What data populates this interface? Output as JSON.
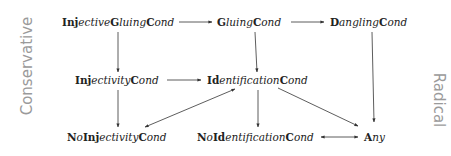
{
  "diagram": {
    "side_labels": {
      "left": "Conservative",
      "right": "Radical"
    },
    "nodes": [
      {
        "id": "injective_gluing",
        "parts": [
          [
            "b",
            "Inj"
          ],
          [
            "i",
            "ective"
          ],
          [
            "b",
            "G"
          ],
          [
            "i",
            "luing"
          ],
          [
            "b",
            "C"
          ],
          [
            "i",
            "ond"
          ]
        ]
      },
      {
        "id": "gluing",
        "parts": [
          [
            "b",
            "G"
          ],
          [
            "i",
            "luing"
          ],
          [
            "b",
            "C"
          ],
          [
            "i",
            "ond"
          ]
        ]
      },
      {
        "id": "dangling",
        "parts": [
          [
            "b",
            "D"
          ],
          [
            "i",
            "angling"
          ],
          [
            "b",
            "C"
          ],
          [
            "i",
            "ond"
          ]
        ]
      },
      {
        "id": "injectivity",
        "parts": [
          [
            "b",
            "Inj"
          ],
          [
            "i",
            "ectivity"
          ],
          [
            "b",
            "C"
          ],
          [
            "i",
            "ond"
          ]
        ]
      },
      {
        "id": "identification",
        "parts": [
          [
            "b",
            "Id"
          ],
          [
            "i",
            "entification"
          ],
          [
            "b",
            "C"
          ],
          [
            "i",
            "ond"
          ]
        ]
      },
      {
        "id": "no_injectivity",
        "parts": [
          [
            "b",
            "N"
          ],
          [
            "i",
            "o"
          ],
          [
            "b",
            "Inj"
          ],
          [
            "i",
            "ectivity"
          ],
          [
            "b",
            "C"
          ],
          [
            "i",
            "ond"
          ]
        ]
      },
      {
        "id": "no_identification",
        "parts": [
          [
            "b",
            "N"
          ],
          [
            "i",
            "o"
          ],
          [
            "b",
            "Id"
          ],
          [
            "i",
            "entification"
          ],
          [
            "b",
            "C"
          ],
          [
            "i",
            "ond"
          ]
        ]
      },
      {
        "id": "any",
        "parts": [
          [
            "b",
            "A"
          ],
          [
            "i",
            "ny"
          ]
        ]
      }
    ],
    "node_text": {
      "injective_gluing": "InjectiveGluingCond",
      "gluing": "GluingCond",
      "dangling": "DanglingCond",
      "injectivity": "InjectivityCond",
      "identification": "IdentificationCond",
      "no_injectivity": "NoInjectivityCond",
      "no_identification": "NoIdentificationCond",
      "any": "Any"
    },
    "edges": [
      {
        "from": "injective_gluing",
        "to": "gluing",
        "type": "directed"
      },
      {
        "from": "gluing",
        "to": "dangling",
        "type": "directed"
      },
      {
        "from": "injective_gluing",
        "to": "injectivity",
        "type": "directed"
      },
      {
        "from": "gluing",
        "to": "identification",
        "type": "directed"
      },
      {
        "from": "dangling",
        "to": "any",
        "type": "directed"
      },
      {
        "from": "injectivity",
        "to": "identification",
        "type": "directed"
      },
      {
        "from": "injectivity",
        "to": "no_injectivity",
        "type": "directed"
      },
      {
        "from": "identification",
        "to": "no_injectivity",
        "type": "bidirectional"
      },
      {
        "from": "identification",
        "to": "no_identification",
        "type": "directed"
      },
      {
        "from": "identification",
        "to": "any",
        "type": "directed"
      },
      {
        "from": "no_identification",
        "to": "any",
        "type": "bidirectional"
      }
    ],
    "colors": {
      "text": "#222222",
      "arrows": "#333333",
      "side_labels": "#9a9a9a",
      "background": "#ffffff"
    }
  }
}
